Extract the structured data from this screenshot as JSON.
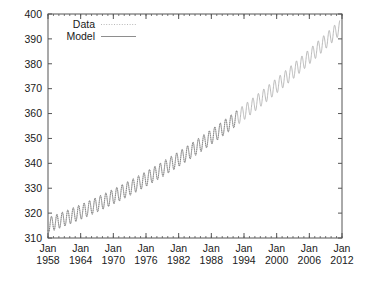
{
  "chart_data": {
    "type": "line",
    "title": "",
    "subtitle": "",
    "xlabel": "",
    "ylabel": "",
    "xlim": [
      1958,
      2012
    ],
    "ylim": [
      310,
      400
    ],
    "grid": false,
    "legend_position": "top-left",
    "x_tick_labels": [
      {
        "line1": "Jan",
        "line2": "1958",
        "value": 1958
      },
      {
        "line1": "Jan",
        "line2": "1964",
        "value": 1964
      },
      {
        "line1": "Jan",
        "line2": "1970",
        "value": 1970
      },
      {
        "line1": "Jan",
        "line2": "1976",
        "value": 1976
      },
      {
        "line1": "Jan",
        "line2": "1982",
        "value": 1982
      },
      {
        "line1": "Jan",
        "line2": "1988",
        "value": 1988
      },
      {
        "line1": "Jan",
        "line2": "1994",
        "value": 1994
      },
      {
        "line1": "Jan",
        "line2": "2000",
        "value": 2000
      },
      {
        "line1": "Jan",
        "line2": "2006",
        "value": 2006
      },
      {
        "line1": "Jan",
        "line2": "2012",
        "value": 2012
      }
    ],
    "x_minor_tick_interval": 1,
    "y_tick_labels": [
      "310",
      "320",
      "330",
      "340",
      "350",
      "360",
      "370",
      "380",
      "390",
      "400"
    ],
    "y_tick_values": [
      310,
      320,
      330,
      340,
      350,
      360,
      370,
      380,
      390,
      400
    ],
    "legend": [
      {
        "name": "Data",
        "style": "dotted",
        "color": "#b9b9b9"
      },
      {
        "name": "Model",
        "style": "solid",
        "color": "#8e8e8e"
      }
    ],
    "series": [
      {
        "name": "Data",
        "style": "dotted",
        "color": "#6f6f6f",
        "x_start": 1958.0,
        "x_end": 1992.8,
        "trend": {
          "type": "quadratic",
          "a": 0.0127,
          "b": 0.8,
          "c": 315.2,
          "x0": 1958.0
        },
        "seasonal_amplitude": 3.0,
        "seasonal_period": 1.0,
        "seasonal_phase": 0.38,
        "samples_per_year": 12
      },
      {
        "name": "Model",
        "style": "solid",
        "color": "#a8a8a8",
        "x_start": 1958.0,
        "x_end": 2011.6,
        "trend": {
          "type": "quadratic",
          "a": 0.0127,
          "b": 0.8,
          "c": 315.2,
          "x0": 1958.0
        },
        "seasonal_amplitude": 3.0,
        "seasonal_period": 1.0,
        "seasonal_phase": 0.38,
        "samples_per_year": 12
      }
    ],
    "annotations": [],
    "approx_values": {
      "start_1958": 315,
      "value_1970": 326,
      "value_1980": 338,
      "value_1990": 354,
      "value_2000": 369,
      "value_2010": 389,
      "end_2011": 391
    }
  },
  "colors": {
    "background": "#ffffff",
    "frame": "#555555",
    "text": "#1a1a1a",
    "data_series": "#6f6f6f",
    "model_series": "#a8a8a8"
  }
}
